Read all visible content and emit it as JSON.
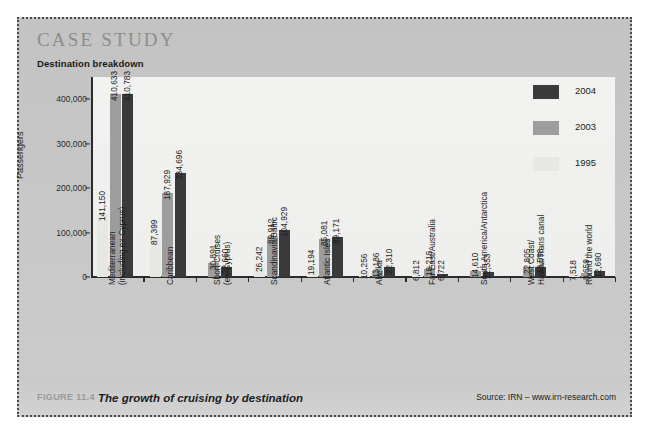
{
  "case_study": {
    "heading": "CASE STUDY",
    "subtitle": "Destination breakdown"
  },
  "legend": {
    "items": [
      {
        "label": "2004",
        "color": "#3a3a3a"
      },
      {
        "label": "2003",
        "color": "#9d9d9d"
      },
      {
        "label": "1995",
        "color": "#e7e7e4"
      }
    ]
  },
  "footer": {
    "figure_number": "FIGURE 11.4",
    "caption": "The growth of cruising by destination",
    "source": "Source: IRN – www.irn-research.com"
  },
  "chart_data": {
    "type": "bar",
    "title": "Destination breakdown",
    "xlabel": "",
    "ylabel": "Passengers",
    "ylim": [
      0,
      450000
    ],
    "yticks": [
      0,
      100000,
      200000,
      300000,
      400000
    ],
    "ytick_labels": [
      "0",
      "100,000",
      "200,000",
      "300,000",
      "400,000"
    ],
    "grid": false,
    "legend_position": "right",
    "categories": [
      "Mediterranean (including ex-Cyprus)",
      "Caribbean",
      "Short Cruises (ex-Cyprus)",
      "Scandinavia/Baltic",
      "Atlantic Isles",
      "Alaska",
      "Far East/Australia",
      "South America/Antarctica",
      "West Coast/ Hawaii/Trans canal",
      "Round the world"
    ],
    "category_lines": [
      [
        "Mediterranean",
        "(including ex-Cyprus)"
      ],
      [
        "Caribbean"
      ],
      [
        "Short Cruises",
        "(ex-Cyprus)"
      ],
      [
        "Scandinavia/Baltic"
      ],
      [
        "Atlantic Isles"
      ],
      [
        "Alaska"
      ],
      [
        "Far East/Australia"
      ],
      [
        "South America/Antarctica"
      ],
      [
        "West Coast/",
        "Hawaii/Trans canal"
      ],
      [
        "Round the world"
      ]
    ],
    "series": [
      {
        "name": "1995",
        "color": "#e7e7e4",
        "values": [
          141150,
          87399,
          null,
          26242,
          19194,
          10256,
          6812,
          null,
          null,
          7518
        ],
        "labels": [
          "141,150",
          "87,399",
          "",
          "26,242",
          "19,194",
          "10,256",
          "6,812",
          "",
          "",
          "7,518"
        ]
      },
      {
        "name": "2003",
        "color": "#9d9d9d",
        "values": [
          410633,
          187929,
          30891,
          89912,
          85081,
          13186,
          18215,
          14610,
          22805,
          8659
        ],
        "labels": [
          "410,633",
          "187,929",
          "30,891",
          "89,912",
          "85,081",
          "13,186",
          "18,215",
          "14,610",
          "22,805",
          "8,659"
        ]
      },
      {
        "name": "2004",
        "color": "#3a3a3a",
        "values": [
          410783,
          234696,
          22660,
          104929,
          89171,
          22310,
          6722,
          12353,
          23598,
          12690
        ],
        "labels": [
          "410,783",
          "234,696",
          "22,660",
          "104,929",
          "89,171",
          "22,310",
          "6,722",
          "12,353",
          "23,598",
          "12,690"
        ]
      }
    ]
  }
}
